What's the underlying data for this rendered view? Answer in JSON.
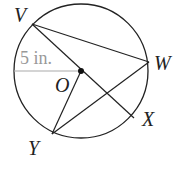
{
  "diagram": {
    "points": {
      "V": "V",
      "W": "W",
      "X": "X",
      "Y": "Y",
      "O": "O"
    },
    "measurement": "5 in."
  }
}
